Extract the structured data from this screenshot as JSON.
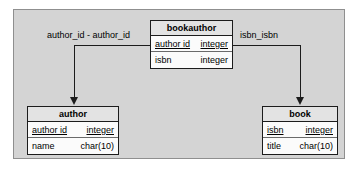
{
  "diagram": {
    "background_color": "#d4d4d4",
    "frame_border_color": "#8f8f8f",
    "entity_fill_color": "#fbfbfb",
    "entity_header_color": "#e3e3e3",
    "line_color": "#1c1c1c"
  },
  "entities": {
    "bookauthor": {
      "name": "bookauthor",
      "attributes": [
        {
          "name": "author id",
          "type": "integer",
          "primary_key": true
        },
        {
          "name": "isbn",
          "type": "integer",
          "primary_key": false
        }
      ]
    },
    "author": {
      "name": "author",
      "attributes": [
        {
          "name": "author id",
          "type": "integer",
          "primary_key": true
        },
        {
          "name": "name",
          "type": "char(10)",
          "primary_key": false
        }
      ]
    },
    "book": {
      "name": "book",
      "attributes": [
        {
          "name": "isbn",
          "type": "integer",
          "primary_key": true
        },
        {
          "name": "title",
          "type": "char(10)",
          "primary_key": false
        }
      ]
    }
  },
  "relationships": [
    {
      "id": "bookauthor-to-author",
      "label": "author_id - author_id",
      "from": "bookauthor",
      "to": "author"
    },
    {
      "id": "bookauthor-to-book",
      "label": "isbn_isbn",
      "from": "bookauthor",
      "to": "book"
    }
  ]
}
